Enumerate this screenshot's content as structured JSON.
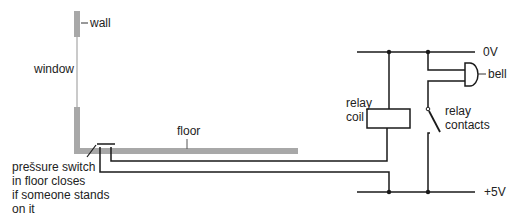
{
  "diagram": {
    "labels": {
      "wall": "wall",
      "window": "window",
      "floor": "floor",
      "switch_line1": "prešsure switch",
      "switch_line2": "in floor closes",
      "switch_line3": "if someone stands",
      "switch_line4": "on it",
      "rail_top": "0V",
      "rail_bottom": "+5V",
      "bell": "bell",
      "coil_line1": "relay",
      "coil_line2": "coil",
      "contacts_line1": "relay",
      "contacts_line2": "contacts"
    },
    "components": [
      "wall",
      "window",
      "floor",
      "pressure-switch",
      "relay-coil",
      "relay-contacts",
      "bell",
      "0V-rail",
      "+5V-rail"
    ],
    "colors": {
      "wire": "#1a1a1a",
      "structure": "#a8a8a8",
      "window": "#b8b8b8",
      "text": "#222222"
    }
  }
}
